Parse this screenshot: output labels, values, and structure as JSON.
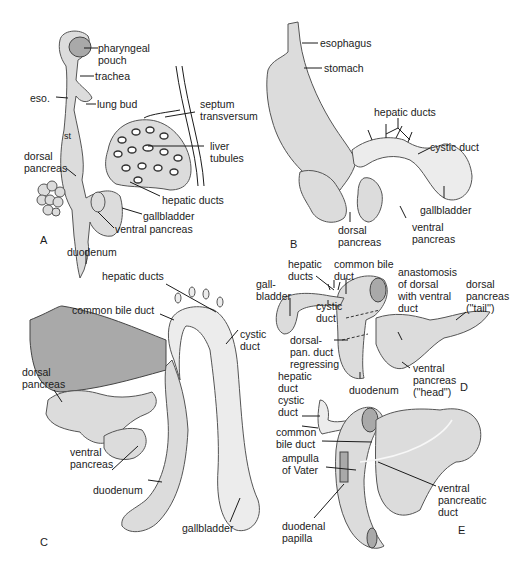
{
  "figure": {
    "panels": [
      {
        "id": "A",
        "letter": "A",
        "labels": [
          "pharyngeal\npouch",
          "trachea",
          "eso.",
          "lung bud",
          "septum\ntransversum",
          "st",
          "liver\ntubules",
          "dorsal\npancreas",
          "hepatic ducts",
          "gallbladder",
          "ventral pancreas",
          "duodenum"
        ]
      },
      {
        "id": "B",
        "letter": "B",
        "labels": [
          "esophagus",
          "stomach",
          "hepatic ducts",
          "cystic duct",
          "gallbladder",
          "ventral\npancreas",
          "dorsal\npancreas"
        ]
      },
      {
        "id": "C",
        "letter": "C",
        "labels": [
          "hepatic ducts",
          "common bile duct",
          "cystic\nduct",
          "dorsal\npancreas",
          "ventral\npancreas",
          "duodenum",
          "gallbladder"
        ]
      },
      {
        "id": "D",
        "letter": "D",
        "labels": [
          "hepatic\nducts",
          "common bile\nduct",
          "gall-\nbladder",
          "cystic\nduct",
          "anastomosis\nof dorsal\nwith ventral\nduct",
          "dorsal\npancreas\n(''tail'')",
          "dorsal-\npan. duct\nregressing",
          "ventral\npancreas\n(''head'')",
          "duodenum"
        ]
      },
      {
        "id": "E",
        "letter": "E",
        "labels": [
          "hepatic\nduct",
          "cystic\nduct",
          "common\nbile duct",
          "ampulla\nof Vater",
          "duodenal\npapilla",
          "ventral\npancreatic\nduct"
        ]
      }
    ]
  }
}
